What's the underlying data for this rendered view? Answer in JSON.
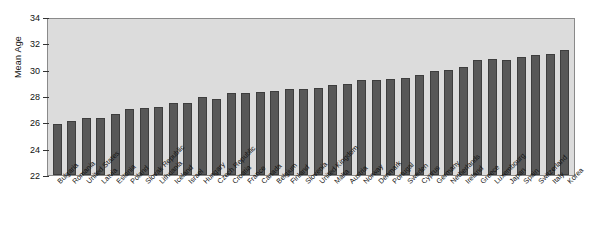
{
  "chart_data": {
    "type": "bar",
    "title": "",
    "xlabel": "",
    "ylabel": "Mean Age",
    "ylim": [
      22,
      34
    ],
    "yticks": [
      22,
      24,
      26,
      28,
      30,
      32,
      34
    ],
    "grid": false,
    "legend": "none",
    "bar_color": "#585858",
    "plot_background": "#dcdcdc",
    "categories": [
      "Bulgaria",
      "Romania",
      "United States",
      "Latvia",
      "Estonia",
      "Poland",
      "Slovak Republic",
      "Lithuania",
      "Iceland",
      "Israel",
      "Hungary",
      "Czech Republic",
      "Croatia",
      "France",
      "Canada",
      "Belgium",
      "Finland",
      "Slovenia",
      "United Kingdom",
      "Malta",
      "Austria",
      "Norway",
      "Denmark",
      "Portugal",
      "Sweden",
      "Cyprus",
      "Germany",
      "Netherlands",
      "Ireland",
      "Greece",
      "Luxembourg",
      "Japan",
      "Spain",
      "Switzerland",
      "Italy",
      "Korea"
    ],
    "values": [
      25.9,
      26.1,
      26.3,
      26.3,
      26.6,
      27.0,
      27.1,
      27.2,
      27.5,
      27.5,
      27.9,
      27.8,
      28.2,
      28.2,
      28.3,
      28.4,
      28.5,
      28.5,
      28.6,
      28.8,
      28.9,
      29.2,
      29.2,
      29.3,
      29.4,
      29.6,
      29.9,
      30.0,
      30.2,
      30.7,
      30.8,
      30.7,
      31.0,
      31.1,
      31.2,
      31.5
    ]
  },
  "axis": {
    "y_title": "Mean Age"
  }
}
